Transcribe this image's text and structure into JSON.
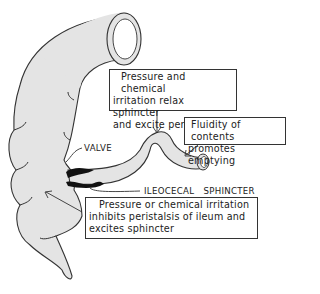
{
  "figure": {
    "type": "anatomical diagram",
    "colors": {
      "organ_fill": "#e4e4e4",
      "outline": "#333333",
      "sphincter": "#111111",
      "background": "#ffffff"
    }
  },
  "callouts": {
    "top": {
      "lines": [
        "Pressure and chemical",
        "irritation relax sphincter",
        "and excite peristalsis"
      ]
    },
    "right": {
      "lines": [
        "Fluidity of contents",
        "promotes emptying"
      ]
    },
    "bottom": {
      "lines": [
        "Pressure or chemical irritation",
        "inhibits peristalsis of ileum and",
        "excites sphincter"
      ]
    }
  },
  "labels": {
    "valve": "VALVE",
    "sphincter": "ILEOCECAL   SPHINCTER"
  }
}
